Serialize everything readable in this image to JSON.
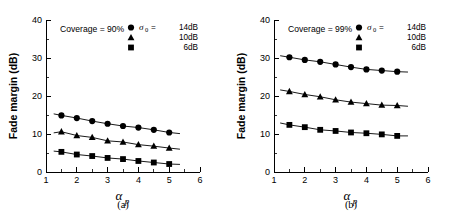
{
  "figure": {
    "panel_count": 2,
    "background_color": "#ffffff",
    "foreground_color": "#000000"
  },
  "panels": [
    {
      "id": "a",
      "caption": "(a)",
      "annotation": "Coverage = 90%",
      "legend": {
        "sigma_symbol": "σ",
        "sigma_subscript": "0",
        "equals": " = ",
        "entries": [
          {
            "marker": "circle",
            "value": "14dB"
          },
          {
            "marker": "triangle",
            "value": "10dB"
          },
          {
            "marker": "square",
            "value": "6dB"
          }
        ]
      }
    },
    {
      "id": "b",
      "caption": "(b)",
      "annotation": "Coverage = 99%",
      "legend": {
        "sigma_symbol": "σ",
        "sigma_subscript": "0",
        "equals": " = ",
        "entries": [
          {
            "marker": "circle",
            "value": "14dB"
          },
          {
            "marker": "triangle",
            "value": "10dB"
          },
          {
            "marker": "square",
            "value": "6dB"
          }
        ]
      }
    }
  ],
  "chart_data": [
    {
      "type": "scatter",
      "panel": "a",
      "title": "Coverage = 90%",
      "xlabel": "α_p",
      "ylabel": "Fade margin (dB)",
      "xlim": [
        1,
        6
      ],
      "ylim": [
        0,
        40
      ],
      "xticks": [
        1,
        2,
        3,
        4,
        5,
        6
      ],
      "yticks": [
        0,
        10,
        20,
        30,
        40
      ],
      "xticks_minor": [
        1.5,
        2.5,
        3.5,
        4.5,
        5.5
      ],
      "yticks_minor": [
        5,
        15,
        25,
        35
      ],
      "grid": false,
      "legend_position": "top-right",
      "x": [
        1.5,
        2.0,
        2.5,
        3.0,
        3.5,
        4.0,
        4.5,
        5.0
      ],
      "series": [
        {
          "name": "14dB",
          "marker": "circle",
          "values": [
            14.9,
            14.2,
            13.4,
            12.7,
            12.1,
            11.7,
            11.1,
            10.4
          ],
          "fit_line": {
            "x": [
              1.25,
              5.35
            ],
            "y": [
              15.3,
              10.1
            ]
          }
        },
        {
          "name": "10dB",
          "marker": "triangle",
          "values": [
            10.6,
            9.6,
            9.1,
            8.2,
            7.9,
            7.2,
            6.8,
            6.3
          ],
          "fit_line": {
            "x": [
              1.25,
              5.35
            ],
            "y": [
              10.3,
              6.0
            ]
          }
        },
        {
          "name": "6dB",
          "marker": "square",
          "values": [
            5.3,
            4.6,
            4.2,
            3.7,
            3.4,
            2.9,
            2.5,
            2.1
          ],
          "fit_line": {
            "x": [
              1.25,
              5.35
            ],
            "y": [
              5.5,
              2.0
            ]
          }
        }
      ]
    },
    {
      "type": "scatter",
      "panel": "b",
      "title": "Coverage = 99%",
      "xlabel": "α_p",
      "ylabel": "Fade margin (dB)",
      "xlim": [
        1,
        6
      ],
      "ylim": [
        0,
        40
      ],
      "xticks": [
        1,
        2,
        3,
        4,
        5,
        6
      ],
      "yticks": [
        0,
        10,
        20,
        30,
        40
      ],
      "xticks_minor": [
        1.5,
        2.5,
        3.5,
        4.5,
        5.5
      ],
      "yticks_minor": [
        5,
        15,
        25,
        35
      ],
      "grid": false,
      "legend_position": "top-right",
      "x": [
        1.5,
        2.0,
        2.5,
        3.0,
        3.5,
        4.0,
        4.5,
        5.0
      ],
      "series": [
        {
          "name": "14dB",
          "marker": "circle",
          "values": [
            30.2,
            29.5,
            29.0,
            28.3,
            27.6,
            27.0,
            26.7,
            26.4
          ],
          "fit_line": {
            "x": [
              1.2,
              5.35
            ],
            "y": [
              30.6,
              26.3
            ]
          }
        },
        {
          "name": "10dB",
          "marker": "triangle",
          "values": [
            21.2,
            20.4,
            19.8,
            19.0,
            18.4,
            18.0,
            17.6,
            17.5
          ],
          "fit_line": {
            "x": [
              1.2,
              5.35
            ],
            "y": [
              21.6,
              17.3
            ]
          }
        },
        {
          "name": "6dB",
          "marker": "square",
          "values": [
            12.4,
            11.8,
            11.1,
            10.8,
            10.4,
            10.2,
            9.9,
            9.5
          ],
          "fit_line": {
            "x": [
              1.2,
              5.35
            ],
            "y": [
              12.9,
              9.5
            ]
          }
        }
      ]
    }
  ]
}
